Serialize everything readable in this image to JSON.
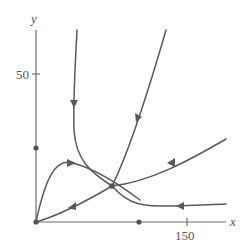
{
  "figure": {
    "type": "phase-portrait",
    "axes": {
      "x_label": "x",
      "y_label": "y",
      "x_tick_label": "150",
      "y_tick_label": "50"
    },
    "colors": {
      "axis": "#6e6e6e",
      "trajectory": "#5a5a5a",
      "text": "#555555"
    },
    "equilibria": [
      {
        "name": "origin",
        "x": 0,
        "y": 0
      },
      {
        "name": "y-axis equilibrium",
        "x": 0,
        "y": 40
      },
      {
        "name": "x-axis equilibrium",
        "x": 100,
        "y": 0
      },
      {
        "name": "interior saddle",
        "x": 75,
        "y": 20
      }
    ],
    "trajectories": [
      {
        "name": "vertical-incoming separatrix",
        "direction": "downward into saddle"
      },
      {
        "name": "upper-right outgoing separatrix",
        "direction": "from saddle upward"
      },
      {
        "name": "hump trajectory from origin",
        "direction": "from origin over hump into saddle region then right-down"
      },
      {
        "name": "lower trajectory from origin",
        "direction": "from origin toward saddle"
      },
      {
        "name": "right incoming separatrix",
        "direction": "from upper-right into saddle"
      },
      {
        "name": "lower-right trajectory",
        "direction": "leftward toward saddle region"
      }
    ]
  }
}
